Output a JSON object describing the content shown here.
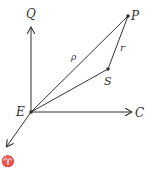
{
  "diagram": {
    "points": {
      "E": {
        "label": "E",
        "x": 31,
        "y": 112
      },
      "P": {
        "label": "P",
        "x": 128,
        "y": 16
      },
      "S": {
        "label": "S",
        "x": 108,
        "y": 69
      },
      "Q": {
        "label": "Q",
        "x": 31,
        "y": 26
      },
      "C": {
        "label": "C",
        "x": 130,
        "y": 112
      },
      "Upsilon": {
        "label": "♈",
        "x": 6,
        "y": 158
      }
    },
    "edges": [
      {
        "from": "E",
        "to": "P",
        "label": "ρ"
      },
      {
        "from": "P",
        "to": "S",
        "label": "r"
      },
      {
        "from": "E",
        "to": "S",
        "label": ""
      },
      {
        "from": "E",
        "to": "Q",
        "label": "",
        "arrow": true
      },
      {
        "from": "E",
        "to": "C",
        "label": "",
        "arrow": true
      },
      {
        "from": "E",
        "to": "Upsilon",
        "label": "",
        "arrow": true
      }
    ],
    "labels": {
      "E": "E",
      "P": "P",
      "S": "S",
      "Q": "Q",
      "C": "C",
      "aries": "♈",
      "rho": "ρ",
      "r": "r"
    },
    "colors": {
      "line": "#333333",
      "background": "#ffffff"
    }
  }
}
